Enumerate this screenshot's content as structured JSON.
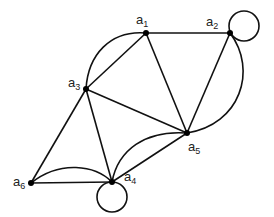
{
  "diagram": {
    "type": "graph",
    "nodes": [
      {
        "id": "a1",
        "label": "a",
        "sub": "1",
        "x": 146,
        "y": 33
      },
      {
        "id": "a2",
        "label": "a",
        "sub": "2",
        "x": 230,
        "y": 33
      },
      {
        "id": "a3",
        "label": "a",
        "sub": "3",
        "x": 86,
        "y": 89
      },
      {
        "id": "a4",
        "label": "a",
        "sub": "4",
        "x": 112,
        "y": 182
      },
      {
        "id": "a5",
        "label": "a",
        "sub": "5",
        "x": 187,
        "y": 133
      },
      {
        "id": "a6",
        "label": "a",
        "sub": "6",
        "x": 31,
        "y": 183
      }
    ],
    "edges": [
      {
        "from": "a1",
        "to": "a2",
        "kind": "straight"
      },
      {
        "from": "a1",
        "to": "a3",
        "kind": "straight"
      },
      {
        "from": "a1",
        "to": "a3",
        "kind": "arc"
      },
      {
        "from": "a1",
        "to": "a5",
        "kind": "straight"
      },
      {
        "from": "a2",
        "to": "a2",
        "kind": "loop"
      },
      {
        "from": "a2",
        "to": "a5",
        "kind": "straight"
      },
      {
        "from": "a2",
        "to": "a5",
        "kind": "arc"
      },
      {
        "from": "a3",
        "to": "a5",
        "kind": "straight"
      },
      {
        "from": "a3",
        "to": "a6",
        "kind": "straight"
      },
      {
        "from": "a3",
        "to": "a4",
        "kind": "straight"
      },
      {
        "from": "a5",
        "to": "a4",
        "kind": "straight"
      },
      {
        "from": "a5",
        "to": "a4",
        "kind": "arc"
      },
      {
        "from": "a6",
        "to": "a4",
        "kind": "straight"
      },
      {
        "from": "a6",
        "to": "a4",
        "kind": "arc"
      },
      {
        "from": "a4",
        "to": "a4",
        "kind": "loop"
      }
    ]
  },
  "labels": {
    "a1": {
      "base": "a",
      "sub": "1"
    },
    "a2": {
      "base": "a",
      "sub": "2"
    },
    "a3": {
      "base": "a",
      "sub": "3"
    },
    "a4": {
      "base": "a",
      "sub": "4"
    },
    "a5": {
      "base": "a",
      "sub": "5"
    },
    "a6": {
      "base": "a",
      "sub": "6"
    }
  }
}
